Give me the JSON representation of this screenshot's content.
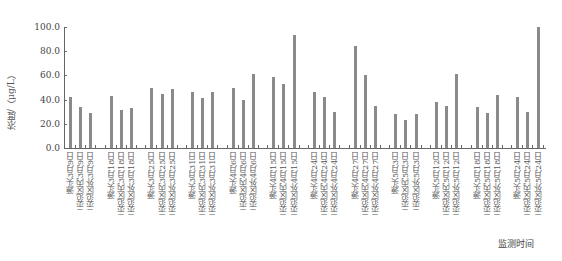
{
  "chart_data": {
    "type": "bar",
    "title": "",
    "ylabel": "浓度/（μg/L）",
    "xlabel": "监测时间",
    "ylim": [
      0,
      100
    ],
    "yticks": [
      "0.0",
      "20.0",
      "40.0",
      "60.0",
      "80.0",
      "100.0"
    ],
    "grid": false,
    "legend": "none",
    "groups": [
      {
        "date": "3月9日",
        "labels": [
          "源头3月9日",
          "示范区内3月9日",
          "示范区外3月9日"
        ],
        "values": [
          42,
          34,
          29
        ]
      },
      {
        "date": "3月18日",
        "labels": [
          "源头3月18日",
          "示范区内3月18日",
          "示范区外3月18日"
        ],
        "values": [
          43,
          31,
          33
        ]
      },
      {
        "date": "3月25日",
        "labels": [
          "源头3月25日",
          "示范区内3月25日",
          "示范区外3月25日"
        ],
        "values": [
          50,
          45,
          49
        ]
      },
      {
        "date": "3月31日",
        "labels": [
          "源头3月31日",
          "示范区内3月31日",
          "示范区外3月31日"
        ],
        "values": [
          46,
          41,
          46
        ]
      },
      {
        "date": "4月6日",
        "labels": [
          "源头4月6日",
          "示范区内4月6日",
          "示范区外4月6日"
        ],
        "values": [
          50,
          40,
          61
        ]
      },
      {
        "date": "4月15日",
        "labels": [
          "源头4月15日",
          "示范区内4月15日",
          "示范区外4月15日"
        ],
        "values": [
          59,
          53,
          93
        ]
      },
      {
        "date": "4月24日",
        "labels": [
          "源头4月24日",
          "示范区内4月24日",
          "示范区外4月24日"
        ],
        "values": [
          46,
          42,
          30
        ]
      },
      {
        "date": "4月27日",
        "labels": [
          "源头4月27日",
          "示范区内4月27日",
          "示范区外4月27日"
        ],
        "values": [
          84,
          60,
          35
        ]
      },
      {
        "date": "5月3日",
        "labels": [
          "源头5月3日",
          "示范区内5月3日",
          "示范区外5月3日"
        ],
        "values": [
          28,
          23,
          28
        ]
      },
      {
        "date": "5月12日",
        "labels": [
          "源头5月12日",
          "示范区内5月12日",
          "示范区外5月12日"
        ],
        "values": [
          38,
          35,
          61
        ]
      },
      {
        "date": "5月18日",
        "labels": [
          "源头5月18日",
          "示范区内5月18日",
          "示范区外5月18日"
        ],
        "values": [
          34,
          29,
          44
        ]
      },
      {
        "date": "5月24日",
        "labels": [
          "源头5月24日",
          "示范区内5月24日",
          "示范区外5月24日"
        ],
        "values": [
          42,
          30,
          100
        ]
      }
    ],
    "categories": [
      "源头3月9日",
      "示范区内3月9日",
      "示范区外3月9日",
      "源头3月18日",
      "示范区内3月18日",
      "示范区外3月18日",
      "源头3月25日",
      "示范区内3月25日",
      "示范区外3月25日",
      "源头3月31日",
      "示范区内3月31日",
      "示范区外3月31日",
      "源头4月6日",
      "示范区内4月6日",
      "示范区外4月6日",
      "源头4月15日",
      "示范区内4月15日",
      "示范区外4月15日",
      "源头4月24日",
      "示范区内4月24日",
      "示范区外4月24日",
      "源头4月27日",
      "示范区内4月27日",
      "示范区外4月27日",
      "源头5月3日",
      "示范区内5月3日",
      "示范区外5月3日",
      "源头5月12日",
      "示范区内5月12日",
      "示范区外5月12日",
      "源头5月18日",
      "示范区内5月18日",
      "示范区外5月18日",
      "源头5月24日",
      "示范区内5月24日",
      "示范区外5月24日"
    ],
    "values": [
      42,
      34,
      29,
      43,
      31,
      33,
      50,
      45,
      49,
      46,
      41,
      46,
      50,
      40,
      61,
      59,
      53,
      93,
      46,
      42,
      30,
      84,
      60,
      35,
      28,
      23,
      28,
      38,
      35,
      61,
      34,
      29,
      44,
      42,
      30,
      100
    ],
    "bar_color": "#8a8a8a"
  }
}
